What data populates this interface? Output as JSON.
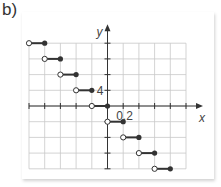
{
  "part_label": "b)",
  "chart_data": {
    "type": "step",
    "title": "",
    "xlabel": "x",
    "ylabel": "y",
    "tick_labels": {
      "x": "0.2",
      "y": "4"
    },
    "x_scale_per_grid": 0.2,
    "y_scale_per_grid": 4,
    "xlim": [
      -1.0,
      1.2
    ],
    "ylim": [
      -16,
      16
    ],
    "grid": true,
    "segments": [
      {
        "x_open": -1.0,
        "x_closed": -0.8,
        "y": 16
      },
      {
        "x_open": -0.8,
        "x_closed": -0.6,
        "y": 12
      },
      {
        "x_open": -0.6,
        "x_closed": -0.4,
        "y": 8
      },
      {
        "x_open": -0.4,
        "x_closed": -0.2,
        "y": 4
      },
      {
        "x_open": -0.2,
        "x_closed": 0.0,
        "y": 0
      },
      {
        "x_open": 0.0,
        "x_closed": 0.2,
        "y": -4
      },
      {
        "x_open": 0.2,
        "x_closed": 0.4,
        "y": -8
      },
      {
        "x_open": 0.4,
        "x_closed": 0.6,
        "y": -12
      },
      {
        "x_open": 0.6,
        "x_closed": 0.8,
        "y": -16
      }
    ]
  },
  "colors": {
    "grid": "#c8c8c8",
    "axis": "#333333",
    "segment": "#333333"
  }
}
